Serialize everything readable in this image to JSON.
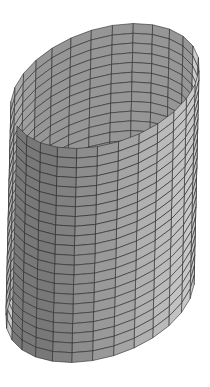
{
  "figure": {
    "caption": "3D mesh rendering of an open elliptical cylinder (tube), flat-shaded with wireframe grid",
    "background": "#ffffff",
    "edge_color": "#2a2a2a",
    "light_gray": "#c4c4c4",
    "dark_gray": "#4a4a4a"
  },
  "mesh": {
    "segments_around": 28,
    "rings_along": 22,
    "radius_a": 1.0,
    "radius_b": 0.55,
    "height": 3.6
  },
  "projection": {
    "top_center": [
      105,
      86
    ],
    "bottom_center": [
      100,
      300
    ],
    "axis_u": [
      88,
      -40
    ],
    "axis_v": [
      34,
      48
    ]
  }
}
